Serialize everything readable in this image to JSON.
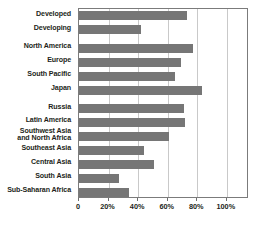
{
  "chart_data": {
    "type": "bar",
    "orientation": "horizontal",
    "title": "",
    "subtitle": "",
    "xlabel": "",
    "ylabel": "",
    "xlim": [
      0,
      115
    ],
    "axis_max_drawn": 115,
    "grid": true,
    "grid_axis": "x",
    "legend": false,
    "legend_position": "none",
    "categories": [
      "Developed",
      "Developing",
      "North America",
      "Europe",
      "South Pacific",
      "Japan",
      "Russia",
      "Latin America",
      "Southwest Asia\nand North Africa",
      "Southeast Asia",
      "Central Asia",
      "South Asia",
      "Sub-Saharan Africa"
    ],
    "values": [
      73,
      42,
      77,
      69,
      65,
      83,
      71,
      72,
      61,
      44,
      51,
      27,
      34
    ],
    "value_unit": "%",
    "tick_values": [
      0,
      20,
      40,
      60,
      80,
      100
    ],
    "tick_labels": [
      "0",
      "20%",
      "40%",
      "60%",
      "80%",
      "100%"
    ],
    "group_breaks_after": [
      1,
      5
    ],
    "colors": {
      "bar": "#767676",
      "gridline": "#c9c9c9",
      "frame": "#7b7b7b",
      "text": "#231f20",
      "background": "#ffffff"
    }
  }
}
